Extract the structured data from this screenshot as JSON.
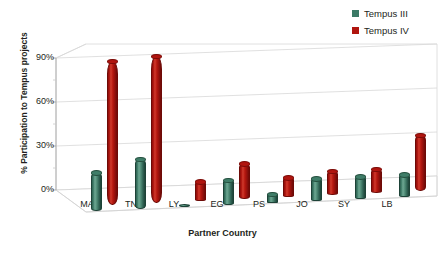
{
  "chart_data": {
    "type": "bar",
    "title": "",
    "xlabel": "Partner Country",
    "ylabel": "% Participation to Tempus projects",
    "categories": [
      "MA",
      "TN",
      "LY",
      "EG",
      "PS",
      "JO",
      "SY",
      "LB"
    ],
    "series": [
      {
        "name": "Tempus III",
        "color": "#3b7a66",
        "values": [
          26,
          34,
          2,
          17,
          6,
          15,
          15,
          15
        ]
      },
      {
        "name": "Tempus IV",
        "color": "#b0150f",
        "values": [
          98,
          100,
          13,
          24,
          13,
          16,
          16,
          38
        ]
      }
    ],
    "ylim": [
      0,
      105
    ],
    "yticks": [
      "0%",
      "30%",
      "60%",
      "90%"
    ],
    "ytick_values": [
      0,
      30,
      60,
      90
    ],
    "grid": true,
    "legend_position": "top-right",
    "projection": "3d-cylinder"
  },
  "legend": {
    "items": [
      {
        "label": "Tempus III",
        "color": "#3b7a66"
      },
      {
        "label": "Tempus IV",
        "color": "#b0150f"
      }
    ]
  },
  "axes": {
    "y_title": "% Participation to Tempus projects",
    "x_title": "Partner Country"
  }
}
